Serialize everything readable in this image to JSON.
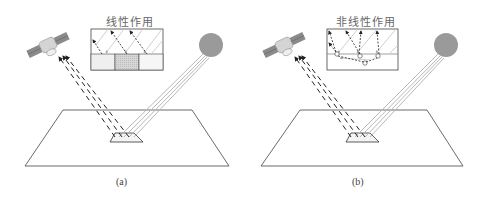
{
  "figure": {
    "panels": [
      {
        "id": "a",
        "caption": "(a)",
        "inset_title": "线性作用",
        "inset_type": "linear",
        "elements": [
          "satellite",
          "sun",
          "ground-plane",
          "target-patch",
          "reflected-dashed-rays",
          "incident-solar-rays",
          "inset-three-pixel-grid"
        ]
      },
      {
        "id": "b",
        "caption": "(b)",
        "inset_title": "非线性作用",
        "inset_type": "nonlinear",
        "elements": [
          "satellite",
          "sun",
          "ground-plane",
          "target-patch",
          "reflected-dashed-rays",
          "incident-solar-rays",
          "inset-multiple-scattering"
        ]
      }
    ],
    "colors": {
      "line": "#333333",
      "sun": "#9a9a9a",
      "solar_ray": "#b8b8b8",
      "dashed_ray": "#222222",
      "pixel_fill_light": "#ececec",
      "pixel_fill_dark": "#cfcfcf"
    }
  }
}
